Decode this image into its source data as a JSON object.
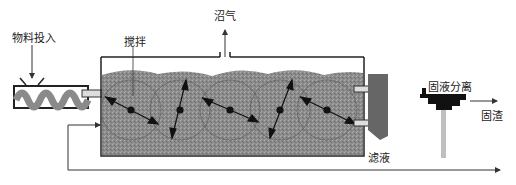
{
  "diagram": {
    "type": "process-flow",
    "labels": {
      "feed_input": "物料投入",
      "stirring": "搅拌",
      "biogas": "沼气",
      "solid_liquid_separation": "固液分离",
      "solid_residue": "固渣",
      "filtrate": "滤液"
    },
    "nodes": [
      {
        "id": "feeder",
        "label": "物料投入",
        "kind": "screw feeder"
      },
      {
        "id": "digester",
        "label": "",
        "kind": "horizontal tank with 5 paddle agitators"
      },
      {
        "id": "discharge",
        "label": "",
        "kind": "outlet hopper"
      },
      {
        "id": "separator",
        "label": "固液分离",
        "kind": "solid-liquid separator"
      }
    ],
    "edges": [
      {
        "from": "feeder",
        "to": "digester"
      },
      {
        "from": "digester",
        "to": "biogas",
        "label": "沼气"
      },
      {
        "from": "digester",
        "to": "discharge"
      },
      {
        "from": "separator",
        "to": "solid_residue",
        "label": "固渣"
      },
      {
        "from": "separator",
        "to": "digester",
        "label": "滤液",
        "note": "filtrate recirculation"
      }
    ],
    "agitator_count": 5,
    "colors": {
      "slurry": "#8a8a8a",
      "line": "#333333",
      "outlet": "#666666",
      "separator": "#111111",
      "pipe": "#bfbfbf"
    }
  }
}
